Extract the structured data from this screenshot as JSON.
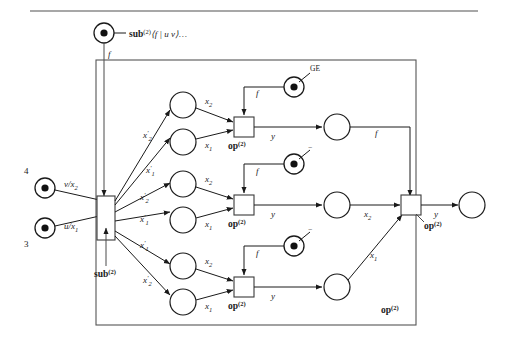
{
  "figure": {
    "type": "petri-net-dataflow-diagram",
    "top_rule": true,
    "title_label": "sub",
    "title_sup": "(2)",
    "title_args": "⟨f | u v⟩…",
    "outer_box_label": "op",
    "outer_box_sup": "(2)"
  },
  "tokens": {
    "source_top": {
      "name": "sub-token",
      "edge_label": "f"
    },
    "input_4": {
      "label": "4",
      "edge_label": "v/x",
      "edge_sub": "2"
    },
    "input_3": {
      "label": "3",
      "edge_label": "u/x",
      "edge_sub": "1"
    },
    "op_token_1": {
      "label": "GE",
      "edge_label": "f"
    },
    "op_token_2": {
      "label": "−",
      "edge_label": "f"
    },
    "op_token_3": {
      "label": "−",
      "edge_label": "f"
    }
  },
  "sub_box": {
    "label": "sub",
    "sup": "(2)"
  },
  "fanout_labels": [
    {
      "base": "x",
      "prime": "′",
      "sub": "2"
    },
    {
      "base": "x",
      "prime": "′",
      "sub": "1"
    },
    {
      "base": "x",
      "prime": "′",
      "sub": "2"
    },
    {
      "base": "x",
      "prime": "′",
      "sub": "1"
    },
    {
      "base": "x",
      "prime": "′",
      "sub": "1"
    },
    {
      "base": "x",
      "prime": "′",
      "sub": "2"
    }
  ],
  "rows": [
    {
      "id": "row-top",
      "in_top": {
        "base": "x",
        "sub": "2"
      },
      "in_bottom": {
        "base": "x",
        "sub": "1"
      },
      "op_label": "op",
      "op_sup": "(2)",
      "out_label": "y",
      "result_edge": "f"
    },
    {
      "id": "row-middle",
      "in_top": {
        "base": "x",
        "sub": "2"
      },
      "in_bottom": {
        "base": "x",
        "sub": "1"
      },
      "op_label": "op",
      "op_sup": "(2)",
      "out_label": "y",
      "result_edge": {
        "base": "x",
        "sub": "2"
      }
    },
    {
      "id": "row-bottom",
      "in_top": {
        "base": "x",
        "sub": "2"
      },
      "in_bottom": {
        "base": "x",
        "sub": "1"
      },
      "op_label": "op",
      "op_sup": "(2)",
      "out_label": "y",
      "result_edge": {
        "base": "x",
        "sub": "1"
      }
    }
  ],
  "final_op": {
    "label": "op",
    "sup": "(2)",
    "out_label": "y"
  },
  "colors": {
    "ink": "#1a1a1a",
    "frame": "#555555",
    "rule": "#8a8a8a"
  }
}
